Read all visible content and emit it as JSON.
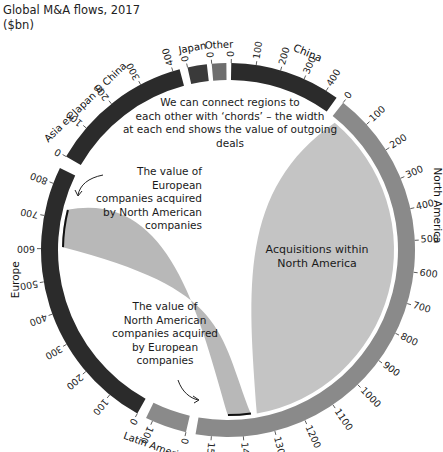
{
  "title": {
    "line1": "Global M&A flows, 2017",
    "line2": "($bn)"
  },
  "annotations": {
    "intro": [
      "We can connect regions to",
      "each other with ‘chords’ – the width",
      "at each end shows the value of outgoing deals"
    ],
    "europe_by_na": [
      "The value of European",
      "companies acquired",
      "by North American",
      "companies"
    ],
    "na_by_europe": [
      "The value of",
      "North American",
      "companies acquired",
      "by European",
      "companies"
    ],
    "within_na": [
      "Acquisitions within",
      "North America"
    ]
  },
  "colors": {
    "dark": "#2b2b2b",
    "china": "#2b2b2b",
    "north_america": "#8a8a8a",
    "europe": "#2b2b2b",
    "asia": "#2b2b2b",
    "japan": "#3a3a3a",
    "other": "#6e6e6e",
    "latin_america": "#8a8a8a",
    "chord_light": "#c4c4c4",
    "chord_mid": "#b8b8b8"
  },
  "chart_data": {
    "type": "chord",
    "title": "Global M&A flows, 2017 ($bn)",
    "regions": [
      {
        "name": "China",
        "total": 450,
        "ticks": [
          0,
          100,
          200,
          300,
          400
        ]
      },
      {
        "name": "North America",
        "total": 1550,
        "ticks": [
          0,
          100,
          200,
          300,
          400,
          500,
          600,
          700,
          800,
          900,
          1000,
          1100,
          1200,
          1300,
          1400,
          1500
        ]
      },
      {
        "name": "Latin America",
        "total": 120,
        "ticks": [
          0,
          100
        ]
      },
      {
        "name": "Europe",
        "total": 850,
        "ticks": [
          0,
          100,
          200,
          300,
          400,
          500,
          600,
          700,
          800
        ]
      },
      {
        "name": "Asia ex Japan & China",
        "total": 420,
        "ticks": [
          0,
          100,
          200,
          300,
          400
        ]
      },
      {
        "name": "Japan",
        "total": 60,
        "ticks": [
          0
        ]
      },
      {
        "name": "Other",
        "total": 50,
        "ticks": [
          0
        ]
      }
    ],
    "highlighted_chords": [
      {
        "from": "North America",
        "to": "North America",
        "label": "Acquisitions within North America",
        "approx_value": 1300
      },
      {
        "from": "North America",
        "to": "Europe",
        "label": "The value of European companies acquired by North American companies",
        "approx_value": 110
      },
      {
        "from": "Europe",
        "to": "North America",
        "label": "The value of North American companies acquired by European companies",
        "approx_value": 90
      }
    ]
  }
}
